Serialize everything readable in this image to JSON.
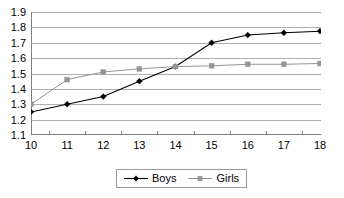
{
  "chart_data": {
    "type": "line",
    "title": "",
    "subtitle": "",
    "xlabel": "",
    "ylabel": "",
    "categories": [
      "10",
      "11",
      "12",
      "13",
      "14",
      "15",
      "16",
      "17",
      "18"
    ],
    "x": [
      10,
      11,
      12,
      13,
      14,
      15,
      16,
      17,
      18
    ],
    "xlim": [
      10,
      18
    ],
    "ylim": [
      1.1,
      1.9
    ],
    "y_ticks": [
      "1.1",
      "1.2",
      "1.3",
      "1.4",
      "1.5",
      "1.6",
      "1.7",
      "1.8",
      "1.9"
    ],
    "y_tick_values": [
      1.1,
      1.2,
      1.3,
      1.4,
      1.5,
      1.6,
      1.7,
      1.8,
      1.9
    ],
    "grid": "horizontal",
    "legend_position": "bottom",
    "series": [
      {
        "name": "Boys",
        "color": "#000000",
        "marker": "diamond",
        "values": [
          1.25,
          1.3,
          1.35,
          1.45,
          1.545,
          1.7,
          1.75,
          1.765,
          1.775
        ]
      },
      {
        "name": "Girls",
        "color": "#969696",
        "marker": "square",
        "values": [
          1.3,
          1.46,
          1.51,
          1.53,
          1.545,
          1.55,
          1.56,
          1.56,
          1.565
        ]
      }
    ]
  },
  "legend": {
    "entries": [
      {
        "label": "Boys"
      },
      {
        "label": "Girls"
      }
    ]
  },
  "colors": {
    "boys": "#000000",
    "girls": "#969696",
    "grid": "#9a9a9a",
    "axis": "#808080",
    "background": "#ffffff"
  }
}
